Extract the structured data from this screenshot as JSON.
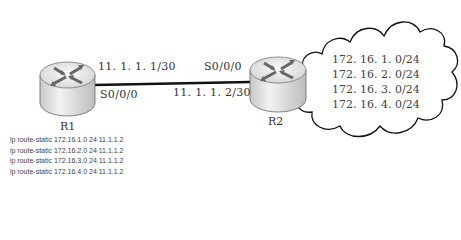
{
  "routers": [
    {
      "name": "R1"
    },
    {
      "name": "R2"
    }
  ],
  "link": {
    "r1_ip": "11. 1. 1. 1/30",
    "r1_iface": "S0/0/0",
    "r2_ip": "11. 1. 1. 2/30",
    "r2_iface": "S0/0/0"
  },
  "cloud": {
    "networks": [
      "172. 16. 1. 0/24",
      "172. 16. 2. 0/24",
      "172. 16. 3. 0/24",
      "172. 16. 4. 0/24"
    ]
  },
  "r1_config": [
    "ip route-static 172.16.1.0 24 11.1.1.2",
    "ip route-static 172.16.2.0 24 11.1.1.2",
    "ip route-static 172.16.3.0 24 11.1.1.2",
    "ip route-static 172.16.4.0 24 11.1.1.2"
  ]
}
